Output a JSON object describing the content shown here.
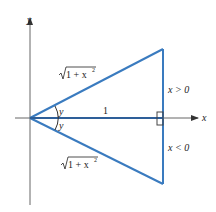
{
  "figure": {
    "axes": {
      "x_label": "x",
      "y_label": "y"
    },
    "labels": {
      "upper_hypotenuse": "√1 + x²",
      "lower_hypotenuse": "√1 + x²",
      "upper_radicand": "1 + x",
      "upper_exponent": "2",
      "lower_radicand": "1 + x",
      "lower_exponent": "2",
      "upper_angle": "y",
      "lower_angle": "y",
      "adjacent_side": "1",
      "upper_condition": "x > 0",
      "lower_condition": "x < 0"
    },
    "colors": {
      "triangle": "#3a7bbf",
      "axis": "#555555",
      "text": "#222222"
    }
  }
}
